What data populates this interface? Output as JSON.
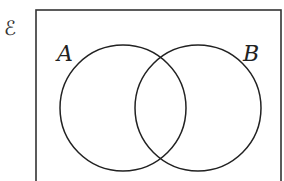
{
  "diagram": {
    "type": "venn",
    "universal_set_symbol": "ℰ",
    "sets": [
      {
        "label": "A",
        "cx": 123,
        "cy": 108,
        "r": 63
      },
      {
        "label": "B",
        "cx": 198,
        "cy": 108,
        "r": 63
      }
    ],
    "frame": {
      "x": 36,
      "y": 10,
      "width": 245,
      "height": 180
    },
    "colors": {
      "stroke": "#222222",
      "background": "#ffffff"
    }
  }
}
